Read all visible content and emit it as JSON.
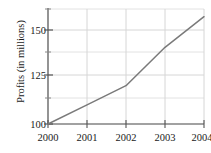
{
  "chart_data": {
    "type": "line",
    "title": "",
    "xlabel": "",
    "ylabel": "Profits (in millions)",
    "x": [
      2000,
      2001,
      2002,
      2003,
      2004
    ],
    "xtick_labels": [
      "2000",
      "2001",
      "2002",
      "2003",
      "2004"
    ],
    "values": [
      100,
      112.5,
      125,
      150,
      170
    ],
    "series": [
      {
        "name": "Profits",
        "values": [
          100,
          112.5,
          125,
          150,
          170
        ]
      }
    ],
    "ytick_labels": [
      "150",
      "125",
      "100"
    ],
    "ytick_values": [
      150,
      125,
      100
    ],
    "yminor_values": [
      162.5,
      137.5,
      112.5
    ],
    "xlim": [
      2000,
      2004
    ],
    "ylim": [
      100,
      175
    ],
    "grid": true,
    "legend": "none",
    "line_color": "#7a7a7a",
    "grid_color": "#d8d8d8",
    "axis_color": "#555555",
    "text_color": "#1a1a1a"
  },
  "axes": {
    "y_title": "Profits (in millions)",
    "y_ticks": [
      {
        "label": "150",
        "value": 150
      },
      {
        "label": "125",
        "value": 125
      },
      {
        "label": "100",
        "value": 100
      }
    ],
    "x_ticks": [
      {
        "label": "2000",
        "value": 2000
      },
      {
        "label": "2001",
        "value": 2001
      },
      {
        "label": "2002",
        "value": 2002
      },
      {
        "label": "2003",
        "value": 2003
      },
      {
        "label": "2004",
        "value": 2004
      }
    ]
  }
}
